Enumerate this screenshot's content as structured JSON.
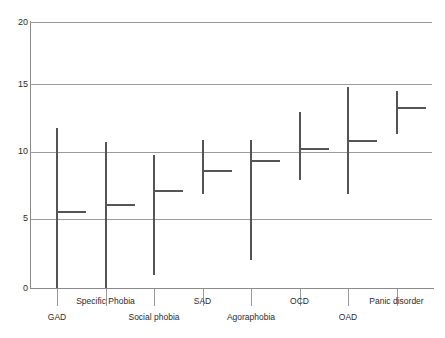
{
  "chart_data": {
    "type": "bar",
    "title": "",
    "subtitle": "",
    "xlabel": "",
    "ylabel": "",
    "ylim": [
      0,
      20
    ],
    "yticks": [
      0,
      5,
      10,
      15,
      20
    ],
    "ytick_labels": [
      "0",
      "5",
      "10",
      "15",
      "20"
    ],
    "grid": true,
    "legend": "none",
    "categories": [
      "GAD",
      "Specific Phobia",
      "Social phobia",
      "SAD",
      "Agoraphobia",
      "OCD",
      "OAD",
      "Panic disorder"
    ],
    "series": [
      {
        "name": "range_low",
        "values": [
          0.0,
          0.0,
          1.0,
          7.1,
          2.1,
          8.1,
          7.1,
          11.6
        ]
      },
      {
        "name": "range_high",
        "values": [
          12.0,
          11.0,
          10.0,
          11.1,
          11.1,
          13.2,
          15.1,
          14.8
        ]
      },
      {
        "name": "point_estimate",
        "values": [
          5.8,
          6.3,
          7.4,
          8.9,
          9.6,
          10.5,
          11.1,
          13.6
        ]
      }
    ],
    "label_rows": [
      1,
      0,
      1,
      0,
      1,
      0,
      1,
      0
    ]
  }
}
